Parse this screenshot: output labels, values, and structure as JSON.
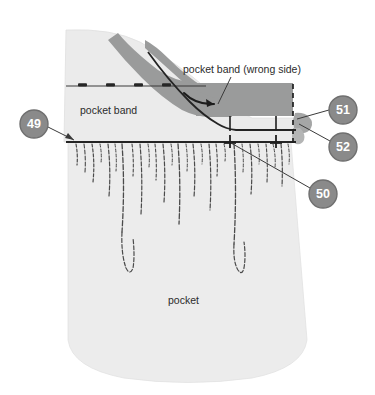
{
  "figure": {
    "name": "pocket-band-sewing-diagram",
    "width": 375,
    "height": 395,
    "background_color": "#ffffff"
  },
  "colors": {
    "fabric_light": "#ebebeb",
    "fabric_light_edge": "#dcdcdc",
    "band_gray": "#9a9b9b",
    "band_gray_dark": "#8d8e8e",
    "stitch_line": "#2e2e2e",
    "callout_fill": "#8a8a8a",
    "callout_stroke": "#6f6f6f",
    "callout_text": "#ffffff",
    "leader_line": "#3a3a3a",
    "text": "#2b2b2b",
    "thread": "#4a4a4a"
  },
  "annotations": {
    "pocket_band_wrong_side": "pocket band (wrong side)",
    "pocket_band": "pocket band",
    "pocket": "pocket"
  },
  "callouts": [
    {
      "id": "49",
      "label": "49",
      "cx": 34,
      "cy": 124,
      "r": 14
    },
    {
      "id": "50",
      "label": "50",
      "cx": 323,
      "cy": 194,
      "r": 14
    },
    {
      "id": "51",
      "label": "51",
      "cx": 343,
      "cy": 110,
      "r": 14
    },
    {
      "id": "52",
      "label": "52",
      "cx": 343,
      "cy": 147,
      "r": 14
    }
  ]
}
